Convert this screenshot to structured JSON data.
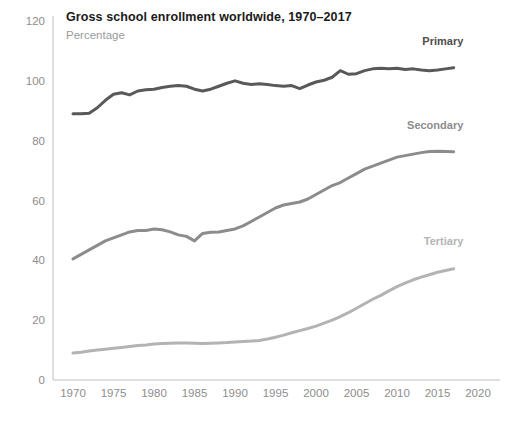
{
  "chart_data": {
    "type": "line",
    "title": "Gross school enrollment worldwide, 1970–2017",
    "subtitle": "Percentage",
    "xlabel": "",
    "ylabel": "",
    "xlim": [
      1968,
      2021
    ],
    "ylim": [
      0,
      120
    ],
    "grid": false,
    "legend_position": "inline-right",
    "xticks": [
      "1970",
      "1975",
      "1980",
      "1985",
      "1990",
      "1995",
      "2000",
      "2005",
      "2010",
      "2015",
      "2020"
    ],
    "yticks": [
      "0",
      "20",
      "40",
      "60",
      "80",
      "100",
      "120"
    ],
    "x": [
      1970,
      1971,
      1972,
      1973,
      1974,
      1975,
      1976,
      1977,
      1978,
      1979,
      1980,
      1981,
      1982,
      1983,
      1984,
      1985,
      1986,
      1987,
      1988,
      1989,
      1990,
      1991,
      1992,
      1993,
      1994,
      1995,
      1996,
      1997,
      1998,
      1999,
      2000,
      2001,
      2002,
      2003,
      2004,
      2005,
      2006,
      2007,
      2008,
      2009,
      2010,
      2011,
      2012,
      2013,
      2014,
      2015,
      2016,
      2017
    ],
    "series": [
      {
        "name": "Primary",
        "color": "#595959",
        "label_color": "#4d4d4d",
        "values": [
          89,
          89,
          89.2,
          91,
          93.5,
          95.5,
          96,
          95.3,
          96.6,
          97,
          97.2,
          97.8,
          98.2,
          98.4,
          98.2,
          97.2,
          96.6,
          97.2,
          98.2,
          99.2,
          100,
          99.2,
          98.8,
          99,
          98.8,
          98.4,
          98.2,
          98.4,
          97.4,
          98.6,
          99.6,
          100.2,
          101.2,
          103.4,
          102.2,
          102.4,
          103.4,
          104,
          104.2,
          104,
          104.2,
          103.8,
          104,
          103.6,
          103.4,
          103.6,
          104,
          104.4
        ]
      },
      {
        "name": "Secondary",
        "color": "#8c8c8c",
        "label_color": "#8c8c8c",
        "values": [
          40.5,
          42,
          43.5,
          45,
          46.5,
          47.5,
          48.5,
          49.5,
          50,
          50,
          50.5,
          50.2,
          49.5,
          48.5,
          48,
          46.5,
          49,
          49.4,
          49.5,
          50,
          50.5,
          51.5,
          53,
          54.5,
          56,
          57.5,
          58.5,
          59,
          59.5,
          60.5,
          62,
          63.5,
          65,
          66,
          67.5,
          69,
          70.5,
          71.5,
          72.5,
          73.5,
          74.5,
          75,
          75.5,
          76,
          76.4,
          76.5,
          76.4,
          76.3
        ]
      },
      {
        "name": "Tertiary",
        "color": "#b3b3b3",
        "label_color": "#b3b3b3",
        "values": [
          9,
          9.3,
          9.7,
          10,
          10.3,
          10.6,
          10.9,
          11.2,
          11.5,
          11.7,
          12,
          12.2,
          12.3,
          12.4,
          12.4,
          12.3,
          12.2,
          12.3,
          12.4,
          12.5,
          12.7,
          12.9,
          13,
          13.2,
          13.7,
          14.3,
          15,
          15.8,
          16.5,
          17.2,
          18,
          19,
          20,
          21.2,
          22.5,
          24,
          25.5,
          27,
          28.3,
          29.8,
          31.2,
          32.4,
          33.5,
          34.4,
          35.2,
          36,
          36.6,
          37.2
        ]
      }
    ],
    "annotations": [
      {
        "name": "Primary",
        "x": 2013,
        "y": 112
      },
      {
        "name": "Secondary",
        "x": 2013,
        "y": 84
      },
      {
        "name": "Tertiary",
        "x": 2013,
        "y": 45
      }
    ]
  }
}
